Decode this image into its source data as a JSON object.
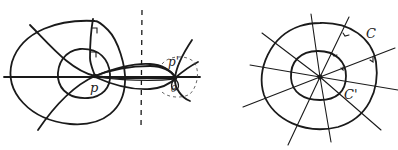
{
  "figure": {
    "colors": {
      "ink": "#1a1a1a",
      "background": "#ffffff"
    },
    "left_panel": {
      "labels": {
        "point_p": "p",
        "point_p_prime": "p'",
        "angle_theta": "θ"
      }
    },
    "right_panel": {
      "labels": {
        "outer_curve": "C",
        "inner_curve": "C'"
      }
    }
  }
}
